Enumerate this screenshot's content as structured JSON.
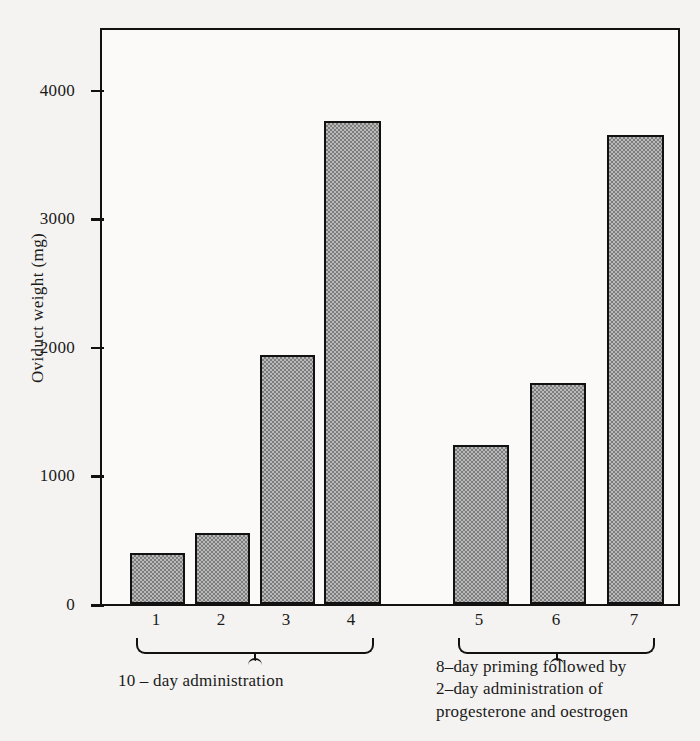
{
  "chart_data": {
    "type": "bar",
    "title": "",
    "xlabel": "",
    "ylabel": "Oviduct weight (mg)",
    "categories": [
      "1",
      "2",
      "3",
      "4",
      "5",
      "6",
      "7"
    ],
    "values": [
      400,
      550,
      1940,
      3760,
      1240,
      1720,
      3650
    ],
    "ylim": [
      0,
      4500
    ],
    "yticks": [
      0,
      1000,
      2000,
      3000,
      4000
    ],
    "ytick_labels": [
      "0",
      "1000",
      "2000",
      "3000",
      "4000"
    ],
    "grid": false,
    "legend": "none",
    "bar_fill_color": "#9a9a9a",
    "bar_edge_color": "#111111",
    "background_color": "#f4f3f1",
    "groups": [
      {
        "name": "10-day administration",
        "categories": [
          "1",
          "2",
          "3",
          "4"
        ],
        "caption_lines": [
          "10 – day  administration"
        ]
      },
      {
        "name": "8-day priming followed by 2-day administration of progesterone and oestrogen",
        "categories": [
          "5",
          "6",
          "7"
        ],
        "caption_lines": [
          "8–day priming followed by",
          "2–day administration of",
          "progesterone and oestrogen"
        ]
      }
    ]
  },
  "axis": {
    "y_title": "Oviduct weight (mg)",
    "y_tick_0": "0",
    "y_tick_1000": "1000",
    "y_tick_2000": "2000",
    "y_tick_3000": "3000",
    "y_tick_4000": "4000"
  },
  "xaxis": {
    "label_1": "1",
    "label_2": "2",
    "label_3": "3",
    "label_4": "4",
    "label_5": "5",
    "label_6": "6",
    "label_7": "7"
  },
  "captions": {
    "left_line_1": "10 – day  administration",
    "right_line_1": "8–day priming followed by",
    "right_line_2": "2–day administration of",
    "right_line_3": "progesterone and oestrogen"
  }
}
